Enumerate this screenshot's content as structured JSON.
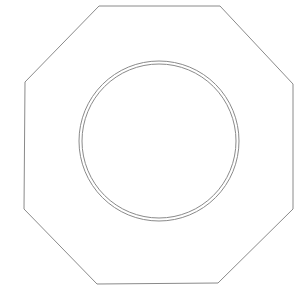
{
  "diagram": {
    "background": "#ffffff",
    "stroke_color": "#8a8a8a",
    "octagon": {
      "points": "99,6 220,6 293,84 293,209 218,283 97,284 24,209 25,82",
      "stroke_width": 1
    },
    "circles": {
      "center_x": 159,
      "center_y": 141,
      "outer_radius": 80,
      "inner_radius": 77,
      "stroke_width": 1
    }
  }
}
